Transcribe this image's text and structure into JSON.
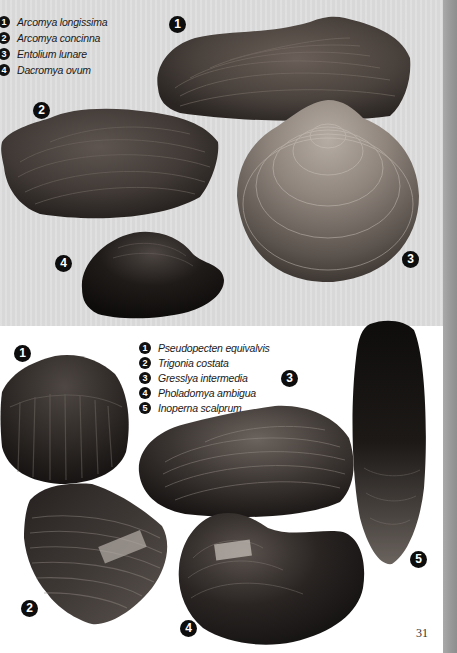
{
  "page": {
    "page_number": "31",
    "colors": {
      "top_panel_bg": "#dcdcdc",
      "bottom_panel_bg": "#ffffff",
      "edge_strip": "#9a9a9a",
      "badge": "#0d0d0d"
    }
  },
  "top_plate": {
    "legend": [
      {
        "number": "1",
        "name": "Arcomya longissima"
      },
      {
        "number": "2",
        "name": "Arcomya concinna"
      },
      {
        "number": "3",
        "name": "Entolium lunare"
      },
      {
        "number": "4",
        "name": "Dacromya ovum"
      }
    ],
    "specimens": [
      {
        "number": "1",
        "name": "Arcomya longissima"
      },
      {
        "number": "2",
        "name": "Arcomya concinna"
      },
      {
        "number": "3",
        "name": "Entolium lunare"
      },
      {
        "number": "4",
        "name": "Dacromya ovum"
      }
    ]
  },
  "bottom_plate": {
    "legend": [
      {
        "number": "1",
        "name": "Pseudopecten equivalvis"
      },
      {
        "number": "2",
        "name": "Trigonia costata"
      },
      {
        "number": "3",
        "name": "Gresslya intermedia"
      },
      {
        "number": "4",
        "name": "Pholadomya ambigua"
      },
      {
        "number": "5",
        "name": "Inoperna scalprum"
      }
    ],
    "specimens": [
      {
        "number": "1",
        "name": "Pseudopecten equivalvis"
      },
      {
        "number": "2",
        "name": "Trigonia costata"
      },
      {
        "number": "3",
        "name": "Gresslya intermedia"
      },
      {
        "number": "4",
        "name": "Pholadomya ambigua"
      },
      {
        "number": "5",
        "name": "Inoperna scalprum"
      }
    ]
  }
}
